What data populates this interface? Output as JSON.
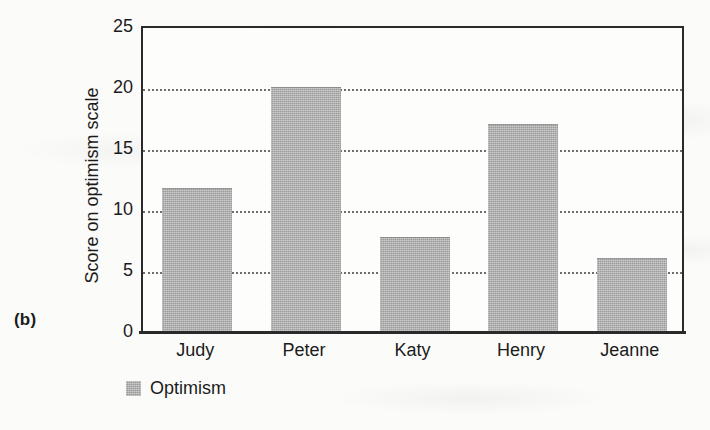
{
  "figure": {
    "panel_label": "(b)"
  },
  "chart_data": {
    "type": "bar",
    "title": "",
    "xlabel": "",
    "ylabel": "Score on optimism scale",
    "categories": [
      "Judy",
      "Peter",
      "Katy",
      "Henry",
      "Jeanne"
    ],
    "values": [
      11.7,
      20.0,
      7.7,
      17.0,
      6.0
    ],
    "series": [
      {
        "name": "Optimism",
        "values": [
          11.7,
          20.0,
          7.7,
          17.0,
          6.0
        ],
        "color": "#9b9b9b"
      }
    ],
    "ylim": [
      0,
      25
    ],
    "yticks": [
      0,
      5,
      10,
      15,
      20,
      25
    ],
    "ytick_labels": [
      "0",
      "5",
      "10",
      "15",
      "20",
      "25"
    ],
    "grid": "horizontal-dotted",
    "legend": {
      "position": "bottom-left",
      "entries": [
        {
          "label": "Optimism",
          "color": "#9b9b9b"
        }
      ]
    }
  },
  "colors": {
    "bar_fill": "#9b9b9b",
    "axis": "#2a2a2a",
    "grid": "#6e6e6e",
    "text": "#1b1b1b",
    "page_background": "#fbfbfa"
  }
}
